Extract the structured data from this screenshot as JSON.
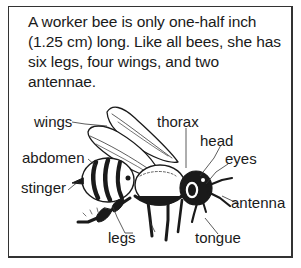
{
  "caption": "A worker bee is only one-half inch (1.25 cm) long. Like all bees, she has six legs, four wings, and two antennae.",
  "labels": {
    "wings": "wings",
    "thorax": "thorax",
    "head": "head",
    "abdomen": "abdomen",
    "eyes": "eyes",
    "stinger": "stinger",
    "antenna": "antenna",
    "legs": "legs",
    "tongue": "tongue"
  },
  "colors": {
    "ink": "#1a1a1a",
    "border": "#333333",
    "background": "#ffffff"
  }
}
